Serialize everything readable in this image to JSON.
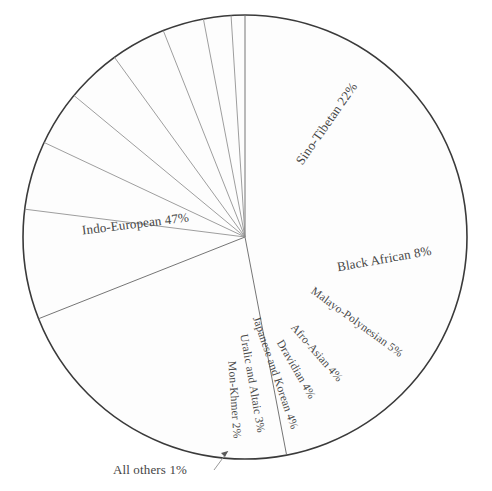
{
  "chart_data": {
    "type": "pie",
    "title": "",
    "subtitle": "",
    "xlabel": "",
    "ylabel": "",
    "grid": false,
    "legend_position": "none",
    "label_format": "name percent",
    "start_angle_deg_from_top": 0,
    "direction": "clockwise",
    "total_percent": 100,
    "categories": [
      "Indo-European",
      "Sino-Tibetan",
      "Black African",
      "Malayo-Polynesian",
      "Afro-Asian",
      "Dravidian",
      "Japanese and Korean",
      "Uralic and Altaic",
      "Mon-Khmer",
      "All others"
    ],
    "values": [
      47,
      22,
      8,
      5,
      4,
      4,
      4,
      3,
      2,
      1
    ],
    "slices": [
      {
        "name": "Indo-European",
        "value": 47,
        "label": "Indo-European 47%",
        "label_x": 136,
        "label_y": 228,
        "label_rotation": -7,
        "label_anchor": "middle",
        "label_style": "label-big",
        "callout": false
      },
      {
        "name": "Sino-Tibetan",
        "value": 22,
        "label": "Sino-Tibetan 22%",
        "label_x": 330,
        "label_y": 126,
        "label_rotation": -55,
        "label_anchor": "middle",
        "label_style": "label-big",
        "callout": false
      },
      {
        "name": "Black African",
        "value": 8,
        "label": "Black African 8%",
        "label_x": 385,
        "label_y": 263,
        "label_rotation": -10,
        "label_anchor": "middle",
        "label_style": "label-big",
        "callout": false
      },
      {
        "name": "Malayo-Polynesian",
        "value": 5,
        "label": "Malayo-Polynesian 5%",
        "label_x": 355,
        "label_y": 325,
        "label_rotation": 36,
        "label_anchor": "middle",
        "label_style": "slice-label",
        "callout": false
      },
      {
        "name": "Afro-Asian",
        "value": 4,
        "label": "Afro-Asian 4%",
        "label_x": 314,
        "label_y": 355,
        "label_rotation": 49,
        "label_anchor": "middle",
        "label_style": "slice-label",
        "callout": false
      },
      {
        "name": "Dravidian",
        "value": 4,
        "label": "Dravidian 4%",
        "label_x": 293,
        "label_y": 371,
        "label_rotation": 60,
        "label_anchor": "middle",
        "label_style": "slice-label",
        "callout": false
      },
      {
        "name": "Japanese and Korean",
        "value": 4,
        "label": "Japanese and Korean 4%",
        "label_x": 272,
        "label_y": 374,
        "label_rotation": 71,
        "label_anchor": "middle",
        "label_style": "slice-label",
        "callout": false
      },
      {
        "name": "Uralic and Altaic",
        "value": 3,
        "label": "Uralic and Altaic 3%",
        "label_x": 249,
        "label_y": 384,
        "label_rotation": 80,
        "label_anchor": "middle",
        "label_style": "slice-label",
        "callout": false
      },
      {
        "name": "Mon-Khmer",
        "value": 2,
        "label": "Mon-Khmer 2%",
        "label_x": 231,
        "label_y": 400,
        "label_rotation": 86,
        "label_anchor": "middle",
        "label_style": "slice-label",
        "callout": false
      },
      {
        "name": "All others",
        "value": 1,
        "label": "All others 1%",
        "label_x": 150,
        "label_y": 474,
        "label_rotation": 0,
        "label_anchor": "middle",
        "label_style": "label-callout",
        "callout": true
      }
    ],
    "geometry": {
      "center_x": 245,
      "center_y": 237,
      "radius": 222,
      "callout_line": "M 214 470 L 228 451",
      "callout_arrow": "M 228 451 L 221 453 L 225 457 Z"
    },
    "colors": {
      "background": "#ffffff",
      "slice_fill": "#fdfdfd",
      "outline": "#3a3a3a",
      "divider": "#8d8d8d",
      "label_text": "#4a4a4a"
    }
  }
}
